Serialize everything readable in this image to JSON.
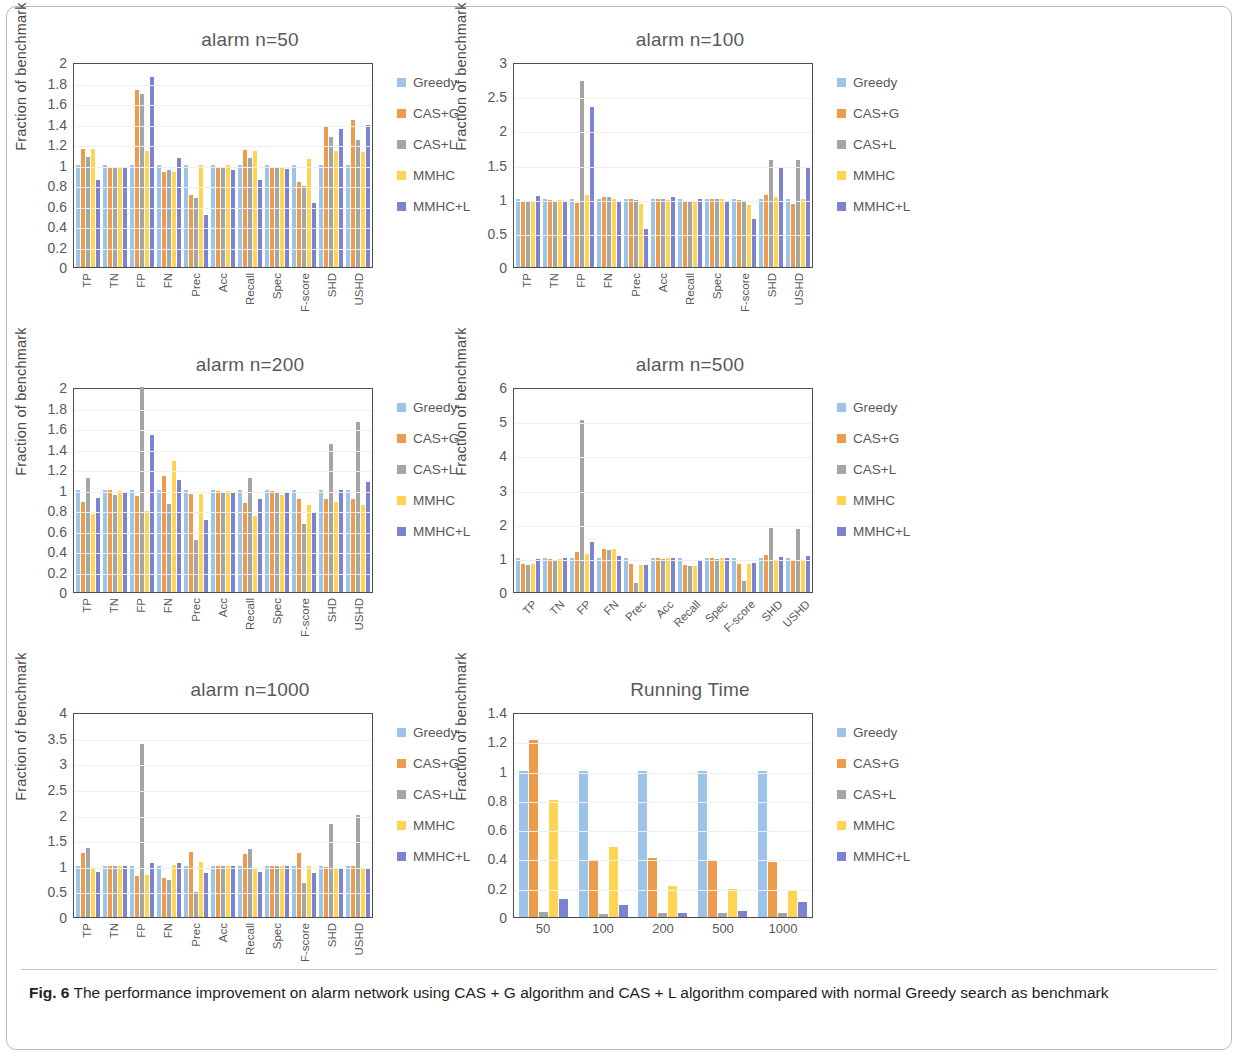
{
  "figure": {
    "caption_label": "Fig. 6",
    "caption_text": " The performance improvement on alarm network using CAS + G algorithm and CAS + L algorithm compared with normal Greedy search as benchmark"
  },
  "series_colors": {
    "Greedy": "#9dc3e6",
    "CAS+G": "#ed9b4c",
    "CAS+L": "#a5a5a5",
    "MMHC": "#ffd451",
    "MMHC+L": "#7c83d3"
  },
  "legend": {
    "items": [
      {
        "label": "Greedy",
        "color": "#9dc3e6"
      },
      {
        "label": "CAS+G",
        "color": "#ed9b4c"
      },
      {
        "label": "CAS+L",
        "color": "#a5a5a5"
      },
      {
        "label": "MMHC",
        "color": "#ffd451"
      },
      {
        "label": "MMHC+L",
        "color": "#7c83d3"
      }
    ]
  },
  "chart_data": [
    {
      "id": "alarm-n-50",
      "type": "bar",
      "title": "alarm n=50",
      "xlabel": "",
      "ylabel": "Fraction of  benchmark",
      "ylim": [
        0,
        2
      ],
      "yticks": [
        0,
        0.2,
        0.4,
        0.6,
        0.8,
        1,
        1.2,
        1.4,
        1.6,
        1.8,
        2
      ],
      "ytick_labels": [
        "0",
        "0.2",
        "0.4",
        "0.6",
        "0.8",
        "1",
        "1.2",
        "1.4",
        "1.6",
        "1.8",
        "2"
      ],
      "grid": true,
      "legend_position": "right",
      "label_rotation": 90,
      "categories": [
        "TP",
        "TN",
        "FP",
        "FN",
        "Prec",
        "Acc",
        "Recall",
        "Spec",
        "F-score",
        "SHD",
        "USHD"
      ],
      "series": [
        {
          "name": "Greedy",
          "values": [
            1.0,
            1.0,
            1.0,
            1.0,
            1.0,
            1.0,
            1.0,
            1.0,
            1.0,
            1.0,
            1.0
          ]
        },
        {
          "name": "CAS+G",
          "values": [
            1.15,
            0.97,
            1.73,
            0.93,
            0.7,
            0.97,
            1.14,
            0.97,
            0.83,
            1.38,
            1.43
          ]
        },
        {
          "name": "CAS+L",
          "values": [
            1.07,
            0.98,
            1.69,
            0.95,
            0.67,
            0.98,
            1.06,
            0.98,
            0.79,
            1.27,
            1.24
          ]
        },
        {
          "name": "MMHC",
          "values": [
            1.15,
            0.98,
            1.13,
            0.93,
            1.0,
            1.0,
            1.13,
            0.98,
            1.05,
            1.13,
            1.12
          ]
        },
        {
          "name": "MMHC+L",
          "values": [
            0.85,
            0.97,
            1.85,
            1.06,
            0.51,
            0.95,
            0.85,
            0.96,
            0.62,
            1.35,
            1.39
          ]
        }
      ]
    },
    {
      "id": "alarm-n-100",
      "type": "bar",
      "title": "alarm n=100",
      "xlabel": "",
      "ylabel": "Fraction of  benchmark",
      "ylim": [
        0,
        3
      ],
      "yticks": [
        0,
        0.5,
        1,
        1.5,
        2,
        2.5,
        3
      ],
      "ytick_labels": [
        "0",
        "0.5",
        "1",
        "1.5",
        "2",
        "2.5",
        "3"
      ],
      "grid": true,
      "legend_position": "right",
      "label_rotation": 90,
      "categories": [
        "TP",
        "TN",
        "FP",
        "FN",
        "Prec",
        "Acc",
        "Recall",
        "Spec",
        "F-score",
        "SHD",
        "USHD"
      ],
      "series": [
        {
          "name": "Greedy",
          "values": [
            1.0,
            1.0,
            1.0,
            1.0,
            1.0,
            1.0,
            1.0,
            1.0,
            1.0,
            1.0,
            1.0
          ]
        },
        {
          "name": "CAS+G",
          "values": [
            0.95,
            0.98,
            0.94,
            1.02,
            1.0,
            1.0,
            0.96,
            1.0,
            0.98,
            1.05,
            0.92
          ]
        },
        {
          "name": "CAS+L",
          "values": [
            0.95,
            0.97,
            2.72,
            1.02,
            0.98,
            0.99,
            0.96,
            0.99,
            0.97,
            1.57,
            1.57
          ]
        },
        {
          "name": "MMHC",
          "values": [
            0.95,
            0.98,
            1.06,
            1.0,
            0.92,
            0.98,
            0.96,
            1.0,
            0.91,
            1.02,
            1.0
          ]
        },
        {
          "name": "MMHC+L",
          "values": [
            1.04,
            0.97,
            2.34,
            0.97,
            0.55,
            1.03,
            1.0,
            0.97,
            0.7,
            1.46,
            1.46
          ]
        }
      ]
    },
    {
      "id": "alarm-n-200",
      "type": "bar",
      "title": "alarm n=200",
      "xlabel": "",
      "ylabel": "Fraction of  benchmark",
      "ylim": [
        0,
        2
      ],
      "yticks": [
        0,
        0.2,
        0.4,
        0.6,
        0.8,
        1,
        1.2,
        1.4,
        1.6,
        1.8,
        2
      ],
      "ytick_labels": [
        "0",
        "0.2",
        "0.4",
        "0.6",
        "0.8",
        "1",
        "1.2",
        "1.4",
        "1.6",
        "1.8",
        "2"
      ],
      "grid": true,
      "legend_position": "right",
      "label_rotation": 90,
      "categories": [
        "TP",
        "TN",
        "FP",
        "FN",
        "Prec",
        "Acc",
        "Recall",
        "Spec",
        "F-score",
        "SHD",
        "USHD"
      ],
      "series": [
        {
          "name": "Greedy",
          "values": [
            1.0,
            1.0,
            1.0,
            1.0,
            1.0,
            1.0,
            1.0,
            1.0,
            1.0,
            1.0,
            1.0
          ]
        },
        {
          "name": "CAS+G",
          "values": [
            0.88,
            1.0,
            0.94,
            1.13,
            0.96,
            0.99,
            0.87,
            0.99,
            0.91,
            0.91,
            0.91
          ]
        },
        {
          "name": "CAS+L",
          "values": [
            1.11,
            0.95,
            2.0,
            0.86,
            0.51,
            0.98,
            1.11,
            0.97,
            0.66,
            1.44,
            1.66
          ]
        },
        {
          "name": "MMHC",
          "values": [
            0.76,
            0.99,
            0.79,
            1.28,
            0.96,
            0.99,
            0.74,
            0.95,
            0.85,
            0.88,
            0.85
          ]
        },
        {
          "name": "MMHC+L",
          "values": [
            0.92,
            0.98,
            1.53,
            1.09,
            0.7,
            0.98,
            0.91,
            0.98,
            0.78,
            1.0,
            1.07
          ]
        }
      ]
    },
    {
      "id": "alarm-n-500",
      "type": "bar",
      "title": "alarm n=500",
      "xlabel": "",
      "ylabel": "Fraction of  benchmark",
      "ylim": [
        0,
        6
      ],
      "yticks": [
        0,
        1,
        2,
        3,
        4,
        5,
        6
      ],
      "ytick_labels": [
        "0",
        "1",
        "2",
        "3",
        "4",
        "5",
        "6"
      ],
      "grid": true,
      "legend_position": "right",
      "label_rotation": 45,
      "categories": [
        "TP",
        "TN",
        "FP",
        "FN",
        "Prec",
        "Acc",
        "Recall",
        "Spec",
        "F-score",
        "SHD",
        "USHD"
      ],
      "series": [
        {
          "name": "Greedy",
          "values": [
            1.0,
            1.0,
            1.0,
            1.0,
            1.0,
            1.0,
            1.0,
            1.0,
            1.0,
            1.0,
            1.0
          ]
        },
        {
          "name": "CAS+G",
          "values": [
            0.81,
            0.96,
            1.17,
            1.26,
            0.82,
            1.0,
            0.8,
            0.99,
            0.82,
            1.07,
            0.95
          ]
        },
        {
          "name": "CAS+L",
          "values": [
            0.8,
            0.93,
            5.03,
            1.22,
            0.25,
            0.96,
            0.77,
            0.97,
            0.33,
            1.86,
            1.85
          ]
        },
        {
          "name": "MMHC",
          "values": [
            0.82,
            0.97,
            1.1,
            1.25,
            0.78,
            0.99,
            0.76,
            0.99,
            0.83,
            0.92,
            0.92
          ]
        },
        {
          "name": "MMHC+L",
          "values": [
            0.96,
            0.99,
            1.46,
            1.05,
            0.79,
            0.99,
            0.94,
            0.99,
            0.84,
            1.02,
            1.06
          ]
        }
      ]
    },
    {
      "id": "alarm-n-1000",
      "type": "bar",
      "title": "alarm n=1000",
      "xlabel": "",
      "ylabel": "Fraction of  benchmark",
      "ylim": [
        0,
        4
      ],
      "yticks": [
        0,
        0.5,
        1,
        1.5,
        2,
        2.5,
        3,
        3.5,
        4
      ],
      "ytick_labels": [
        "0",
        "0.5",
        "1",
        "1.5",
        "2",
        "2.5",
        "3",
        "3.5",
        "4"
      ],
      "grid": true,
      "legend_position": "right",
      "label_rotation": 90,
      "categories": [
        "TP",
        "TN",
        "FP",
        "FN",
        "Prec",
        "Acc",
        "Recall",
        "Spec",
        "F-score",
        "SHD",
        "USHD"
      ],
      "series": [
        {
          "name": "Greedy",
          "values": [
            1.0,
            1.0,
            1.0,
            1.0,
            1.0,
            1.0,
            1.0,
            1.0,
            1.0,
            1.0,
            1.0
          ]
        },
        {
          "name": "CAS+G",
          "values": [
            1.24,
            0.99,
            0.8,
            0.77,
            1.27,
            1.0,
            1.22,
            0.99,
            1.25,
            0.98,
            0.99
          ]
        },
        {
          "name": "CAS+L",
          "values": [
            1.34,
            1.0,
            3.37,
            0.73,
            0.48,
            0.99,
            1.32,
            0.99,
            0.67,
            1.82,
            2.0
          ]
        },
        {
          "name": "MMHC",
          "values": [
            0.96,
            0.99,
            0.82,
            1.02,
            1.07,
            0.99,
            0.94,
            0.99,
            0.99,
            0.95,
            0.96
          ]
        },
        {
          "name": "MMHC+L",
          "values": [
            0.88,
            1.0,
            1.06,
            1.05,
            0.86,
            0.99,
            0.87,
            0.99,
            0.85,
            0.94,
            0.93
          ]
        }
      ]
    },
    {
      "id": "running-time",
      "type": "bar",
      "title": "Running Time",
      "xlabel": "",
      "ylabel": "Fraction of  benchmark",
      "ylim": [
        0,
        1.4
      ],
      "yticks": [
        0,
        0.2,
        0.4,
        0.6,
        0.8,
        1,
        1.2,
        1.4
      ],
      "ytick_labels": [
        "0",
        "0.2",
        "0.4",
        "0.6",
        "0.8",
        "1",
        "1.2",
        "1.4"
      ],
      "grid": true,
      "legend_position": "right",
      "label_rotation": 0,
      "categories": [
        "50",
        "100",
        "200",
        "500",
        "1000"
      ],
      "series": [
        {
          "name": "Greedy",
          "values": [
            1.0,
            1.0,
            1.0,
            1.0,
            1.0
          ]
        },
        {
          "name": "CAS+G",
          "values": [
            1.21,
            0.385,
            0.4,
            0.38,
            0.375
          ]
        },
        {
          "name": "CAS+L",
          "values": [
            0.035,
            0.02,
            0.025,
            0.03,
            0.025
          ]
        },
        {
          "name": "MMHC",
          "values": [
            0.8,
            0.48,
            0.215,
            0.19,
            0.18
          ]
        },
        {
          "name": "MMHC+L",
          "values": [
            0.12,
            0.085,
            0.03,
            0.04,
            0.105
          ]
        }
      ]
    }
  ]
}
